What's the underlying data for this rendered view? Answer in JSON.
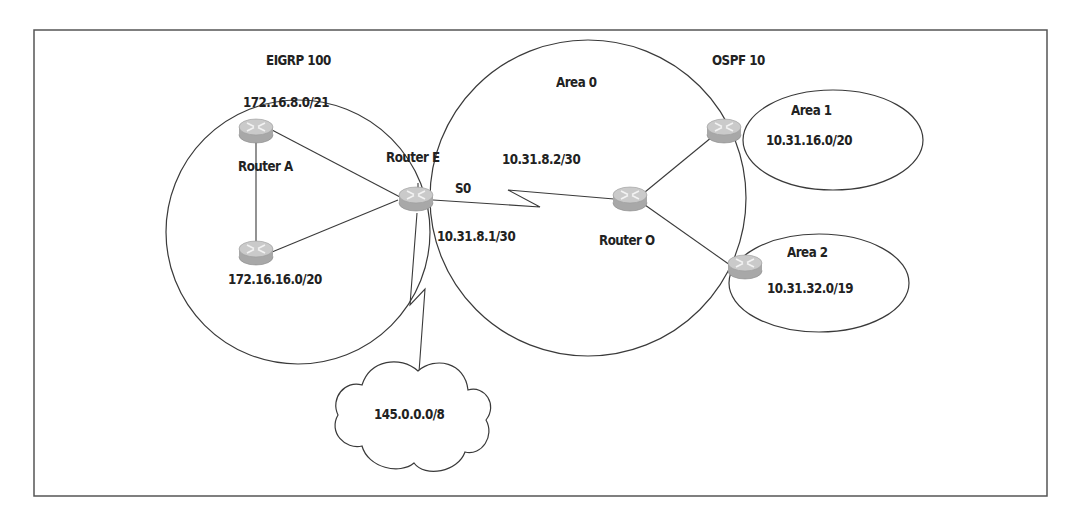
{
  "diagram": {
    "type": "network-topology",
    "domains": {
      "eigrp": {
        "label": "EIGRP 100"
      },
      "ospf": {
        "label": "OSPF 10"
      },
      "area0": {
        "label": "Area 0"
      },
      "area1": {
        "label": "Area 1",
        "subnet": "10.31.16.0/20"
      },
      "area2": {
        "label": "Area 2",
        "subnet": "10.31.32.0/19"
      }
    },
    "subnets": {
      "eigrp_top": "172.16.8.0/21",
      "eigrp_bottom": "172.16.16.0/20",
      "serial_e": "10.31.8.1/30",
      "serial_o": "10.31.8.2/30",
      "cloud": "145.0.0.0/8"
    },
    "routers": {
      "a": {
        "label": "Router A"
      },
      "e": {
        "label": "Router E",
        "interface": "S0"
      },
      "o": {
        "label": "Router O"
      }
    },
    "colors": {
      "line": "#3a3a3a",
      "router_top": "#c9c9c9",
      "router_side": "#a9a9a9",
      "text": "#222222"
    }
  }
}
